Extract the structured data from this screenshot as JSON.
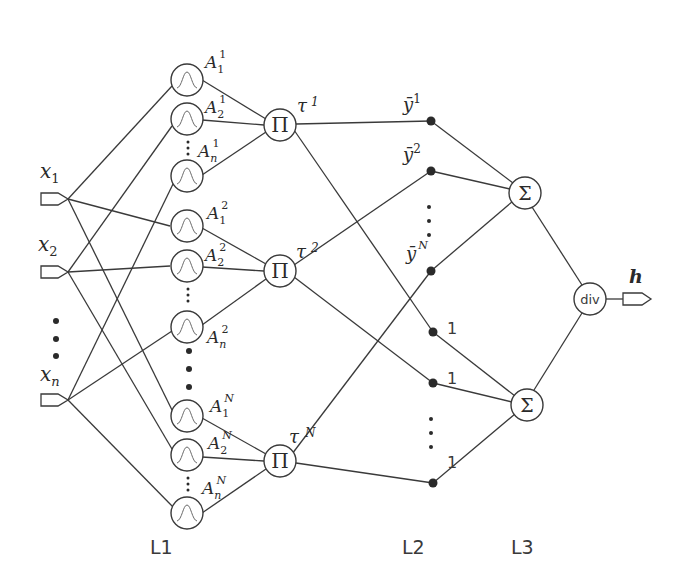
{
  "diagram": {
    "type": "fuzzy neural network",
    "layers": {
      "l1": "L1",
      "l2": "L2",
      "l3": "L3"
    },
    "inputs": [
      {
        "base": "x",
        "sub": "1"
      },
      {
        "base": "x",
        "sub": "2"
      },
      {
        "base": "x",
        "sub": "n"
      }
    ],
    "membership_groups": [
      {
        "rule": "1",
        "nodes": [
          {
            "base": "A",
            "sub": "1",
            "sup": "1"
          },
          {
            "base": "A",
            "sub": "2",
            "sup": "1"
          },
          {
            "base": "A",
            "sub": "n",
            "sup": "1"
          }
        ]
      },
      {
        "rule": "2",
        "nodes": [
          {
            "base": "A",
            "sub": "1",
            "sup": "2"
          },
          {
            "base": "A",
            "sub": "2",
            "sup": "2"
          },
          {
            "base": "A",
            "sub": "n",
            "sup": "2"
          }
        ]
      },
      {
        "rule": "N",
        "nodes": [
          {
            "base": "A",
            "sub": "1",
            "sup": "N"
          },
          {
            "base": "A",
            "sub": "2",
            "sup": "N"
          },
          {
            "base": "A",
            "sub": "n",
            "sup": "N"
          }
        ]
      }
    ],
    "product_nodes": [
      {
        "symbol": "Π",
        "label_base": "τ",
        "label_sup": "1"
      },
      {
        "symbol": "Π",
        "label_base": "τ",
        "label_sup": "2"
      },
      {
        "symbol": "Π",
        "label_base": "τ",
        "label_sup": "N"
      }
    ],
    "weights_top": [
      {
        "base": "ȳ",
        "sup": "1"
      },
      {
        "base": "ȳ",
        "sup": "2"
      },
      {
        "base": "ȳ",
        "sup": "N"
      }
    ],
    "weights_bottom": [
      "1",
      "1",
      "1"
    ],
    "sum_nodes": [
      {
        "symbol": "Σ"
      },
      {
        "symbol": "Σ"
      }
    ],
    "divide_node": {
      "symbol": "div"
    },
    "output": {
      "label": "h"
    }
  }
}
